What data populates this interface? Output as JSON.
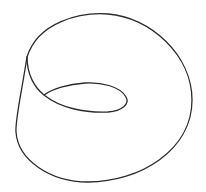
{
  "figure": {
    "title": "Möbius strip line drawing",
    "background": "#ffffff",
    "stroke_color": "#2a2a2a",
    "stroke_width": 1.3,
    "paths": {
      "outer_edge": "M 27 57 C 38 22, 80 12, 108 14 C 150 17, 192 55, 192 100 C 192 150, 140 182, 88 182 C 50 182, 18 160, 16 132 C 15 120, 22 90, 27 57",
      "inner_fold": "M 27 57 C 27 75, 35 88, 44 95 C 60 108, 85 113, 108 112 C 122 111, 130 104, 126 97 C 120 86, 100 82, 85 83 C 68 84, 52 89, 44 95"
    }
  }
}
